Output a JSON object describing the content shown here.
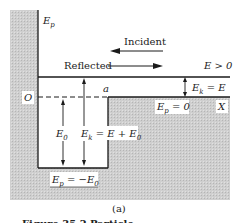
{
  "figure": {
    "panel_label": "(a)",
    "caption_partial": "Figure 35.2  Particle ...",
    "axis": {
      "y_label": "E",
      "y_label_sub": "p",
      "x_label": "X",
      "origin_label": "O"
    },
    "arrows": {
      "incident_label": "Incident",
      "reflected_label": "Reflected"
    },
    "levels": {
      "energy_label": "E > 0",
      "ek_right_main": "E",
      "ek_right_sub": "k",
      "ek_right_rest": " = E",
      "ep_zero_main": "E",
      "ep_zero_sub": "p",
      "ep_zero_rest": " = 0",
      "ep_well_main": "E",
      "ep_well_sub": "p",
      "ep_well_rest": " = −E",
      "ep_well_rest_sub": "0",
      "e0_main": "E",
      "e0_sub": "0",
      "ek_well_main": "E",
      "ek_well_sub": "k",
      "ek_well_rest": " = E + E",
      "ek_well_rest_sub": "0",
      "well_width_label": "a"
    },
    "colors": {
      "shade": "#c9c9c9",
      "line": "#1a1a1a",
      "background": "#ffffff"
    }
  }
}
